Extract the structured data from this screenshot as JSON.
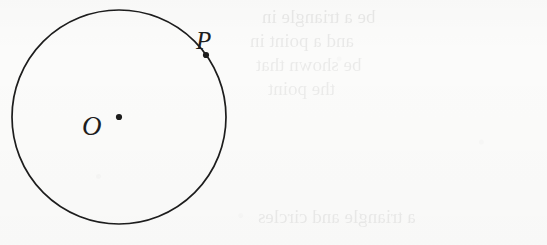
{
  "figure": {
    "type": "circle-with-center-and-point",
    "background_color": "#fbfbfa",
    "ink_color": "#1d1d1d",
    "circle": {
      "center_x": 119,
      "center_y": 117,
      "radius": 107,
      "stroke_width": 1.7
    },
    "points": [
      {
        "id": "center",
        "label": "O",
        "x": 119,
        "y": 117,
        "dot_radius": 3.1,
        "label_x": 82,
        "label_y": 113
      },
      {
        "id": "on-circle",
        "label": "P",
        "x": 206,
        "y": 55,
        "dot_radius": 3.1,
        "label_x": 196,
        "label_y": 28
      }
    ]
  },
  "bleed_through": {
    "note": "Faint mirrored show-through text from the reverse side of the scanned page; illegible.",
    "lines": [
      {
        "text": "be a triangle in",
        "x": 262,
        "y": 6,
        "size": 19,
        "opacity": 0.085
      },
      {
        "text": "and a point in",
        "x": 250,
        "y": 30,
        "size": 19,
        "opacity": 0.08
      },
      {
        "text": "be shown that",
        "x": 256,
        "y": 54,
        "size": 19,
        "opacity": 0.075
      },
      {
        "text": "the point",
        "x": 268,
        "y": 78,
        "size": 19,
        "opacity": 0.07
      },
      {
        "text": "a triangle and circles",
        "x": 258,
        "y": 206,
        "size": 19,
        "opacity": 0.08
      }
    ]
  }
}
